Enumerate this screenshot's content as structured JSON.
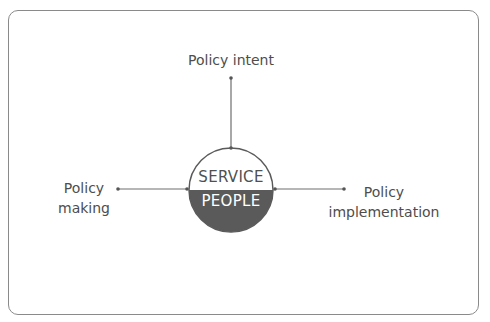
{
  "diagram": {
    "center": {
      "top_label": "SERVICE",
      "bottom_label": "PEOPLE"
    },
    "nodes": {
      "top": "Policy intent",
      "left_line1": "Policy",
      "left_line2": "making",
      "right_line1": "Policy",
      "right_line2": "implementation"
    },
    "colors": {
      "dark": "#5a5a5a",
      "line": "#6e6e6e",
      "text": "#4d4d4d",
      "border": "#8a8a8a"
    }
  }
}
